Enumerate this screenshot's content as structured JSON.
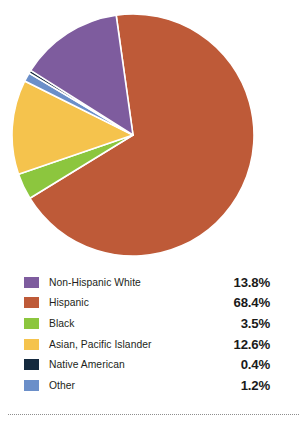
{
  "chart_data": {
    "type": "pie",
    "title": "",
    "subtitle": "",
    "xlabel": "",
    "ylabel": "",
    "legend_position": "bottom",
    "grid": false,
    "unit": "%",
    "start_angle_deg": -8,
    "direction": "clockwise",
    "categories": [
      "Non-Hispanic White",
      "Hispanic",
      "Black",
      "Asian, Pacific Islander",
      "Native American",
      "Other"
    ],
    "values": [
      13.8,
      68.4,
      3.5,
      12.6,
      0.4,
      1.2
    ],
    "value_labels": [
      "13.8%",
      "68.4%",
      "3.5%",
      "12.6%",
      "0.4%",
      "1.2%"
    ],
    "colors": {
      "Non-Hispanic White": "#7E5C9E",
      "Hispanic": "#BE5A38",
      "Black": "#8CC63E",
      "Asian, Pacific Islander": "#F5C34D",
      "Native American": "#152A3E",
      "Other": "#6B8FC9"
    },
    "slice_order_clockwise": [
      "Hispanic",
      "Black",
      "Asian, Pacific Islander",
      "Other",
      "Native American",
      "Non-Hispanic White"
    ],
    "slices": [
      {
        "label": "Hispanic",
        "value": 68.4,
        "value_label": "68.4%",
        "color": "#BE5A38"
      },
      {
        "label": "Black",
        "value": 3.5,
        "value_label": "3.5%",
        "color": "#8CC63E"
      },
      {
        "label": "Asian, Pacific Islander",
        "value": 12.6,
        "value_label": "12.6%",
        "color": "#F5C34D"
      },
      {
        "label": "Other",
        "value": 1.2,
        "value_label": "1.2%",
        "color": "#6B8FC9"
      },
      {
        "label": "Native American",
        "value": 0.4,
        "value_label": "0.4%",
        "color": "#152A3E"
      },
      {
        "label": "Non-Hispanic White",
        "value": 13.8,
        "value_label": "13.8%",
        "color": "#7E5C9E"
      }
    ]
  },
  "legend": {
    "rows": [
      {
        "label": "Non-Hispanic White",
        "value": "13.8%",
        "color": "#7E5C9E"
      },
      {
        "label": "Hispanic",
        "value": "68.4%",
        "color": "#BE5A38"
      },
      {
        "label": "Black",
        "value": "3.5%",
        "color": "#8CC63E"
      },
      {
        "label": "Asian, Pacific Islander",
        "value": "12.6%",
        "color": "#F5C34D"
      },
      {
        "label": "Native American",
        "value": "0.4%",
        "color": "#152A3E"
      },
      {
        "label": "Other",
        "value": "1.2%",
        "color": "#6B8FC9"
      }
    ]
  }
}
